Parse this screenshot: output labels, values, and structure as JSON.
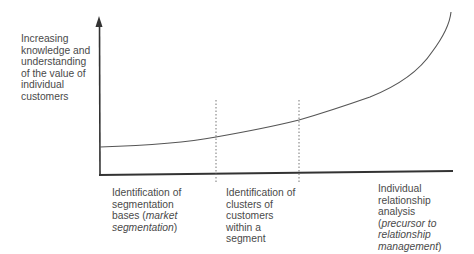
{
  "y_axis": {
    "label_lines": [
      "Increasing",
      "knowledge and",
      "understanding",
      "of the value of",
      "individual",
      "customers"
    ]
  },
  "stages": [
    {
      "lines": [
        {
          "text": "Identification of"
        },
        {
          "text": "segmentation"
        },
        {
          "text": "bases (",
          "italic_after": "market",
          "tail": ""
        },
        {
          "text": "",
          "italic_prefix": "segmentation",
          "tail": ")"
        }
      ],
      "plain": "Identification of segmentation bases (market segmentation)"
    },
    {
      "lines": [
        {
          "text": "Identification of"
        },
        {
          "text": "clusters of"
        },
        {
          "text": "customers"
        },
        {
          "text": "within a"
        },
        {
          "text": "segment"
        }
      ],
      "plain": "Identification of clusters of customers within a segment"
    },
    {
      "lines": [
        {
          "text": "Individual"
        },
        {
          "text": "relationship"
        },
        {
          "text": "analysis"
        },
        {
          "text": "(",
          "italic_after": "precursor to",
          "tail": ""
        },
        {
          "text": "",
          "italic_prefix": "relationship",
          "tail": ""
        },
        {
          "text": "",
          "italic_prefix": "management",
          "tail": ")"
        }
      ],
      "plain": "Individual relationship analysis (precursor to relationship management)"
    }
  ],
  "text": {
    "y1": "Increasing",
    "y2": "knowledge and",
    "y3": "understanding",
    "y4": "of the value of",
    "y5": "individual",
    "y6": "customers",
    "s1a": "Identification of",
    "s1b": "segmentation",
    "s1c": "bases (",
    "s1c_i": "market",
    "s1d_i": "segmentation",
    "s1d": ")",
    "s2a": "Identification of",
    "s2b": "clusters of",
    "s2c": "customers",
    "s2d": "within a",
    "s2e": "segment",
    "s3a": "Individual",
    "s3b": "relationship",
    "s3c": "analysis",
    "s3d": "(",
    "s3d_i": "precursor to",
    "s3e_i": "relationship",
    "s3f_i": "management",
    "s3f": ")"
  },
  "colors": {
    "axis": "#333333",
    "curve": "#555555",
    "divider": "#777777",
    "text": "#4a4a4a"
  }
}
